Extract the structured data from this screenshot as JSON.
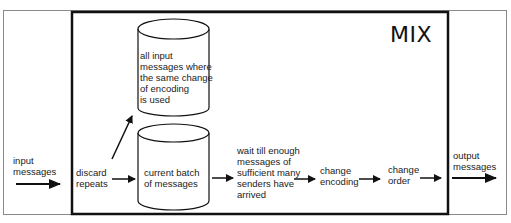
{
  "diagram": {
    "box_title": "MIX",
    "input_label": "input\nmessages",
    "output_label": "output\nmessages",
    "steps": [
      {
        "id": "discard",
        "label": "discard\nrepeats"
      },
      {
        "id": "batch",
        "label": "current batch\nof messages",
        "shape": "cylinder"
      },
      {
        "id": "wait",
        "label": "wait till enough\nmessages of\nsufficient many\nsenders have\narrived"
      },
      {
        "id": "encoding",
        "label": "change\nencoding"
      },
      {
        "id": "order",
        "label": "change\norder"
      }
    ],
    "store": {
      "label": "all input\nmessages where\nthe same  change\nof encoding\nis used",
      "shape": "cylinder"
    },
    "colors": {
      "stroke": "#111111",
      "frame": "#888888",
      "background": "#ffffff",
      "text": "#222222"
    }
  }
}
